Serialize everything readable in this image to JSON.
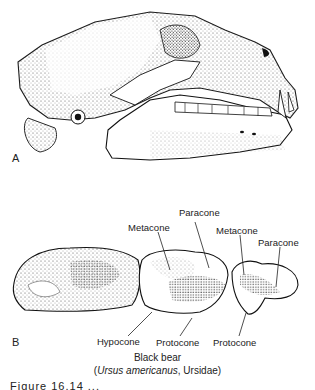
{
  "figure": {
    "panel_a": {
      "letter": "A",
      "subject": "skull-lateral-view"
    },
    "panel_b": {
      "letter": "B",
      "subject": "upper-molars-occlusal-view",
      "labels": {
        "metacone_m1": "Metacone",
        "paracone_m1": "Paracone",
        "metacone_p4": "Metacone",
        "paracone_p4": "Paracone",
        "hypocone": "Hypocone",
        "protocone_m1": "Protocone",
        "protocone_p4": "Protocone"
      }
    },
    "caption": {
      "common_name": "Black bear",
      "open_paren": "(",
      "scientific_name": "Ursus americanus",
      "family": ", Ursidae)"
    },
    "truncated_caption": "Figure 16.14 ..."
  }
}
